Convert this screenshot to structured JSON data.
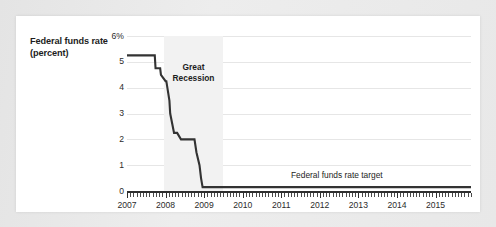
{
  "card": {
    "background_color": "#ffffff",
    "page_background_color": "#e9e9e9"
  },
  "chart_data": {
    "type": "line",
    "title": "",
    "ylabel": "Federal funds rate (percent)",
    "xlabel": "",
    "ylim": [
      0,
      6
    ],
    "xlim": [
      2007.0,
      2015.92
    ],
    "grid": true,
    "legend": "none",
    "line_color": "#333333",
    "y_ticks": [
      0,
      1,
      2,
      3,
      4,
      5,
      6
    ],
    "y_tick_labels": [
      "0",
      "1",
      "2",
      "3",
      "4",
      "5",
      "6%"
    ],
    "x_ticks": [
      2007,
      2008,
      2009,
      2010,
      2011,
      2012,
      2013,
      2014,
      2015
    ],
    "x_tick_labels": [
      "2007",
      "2008",
      "2009",
      "2010",
      "2011",
      "2012",
      "2013",
      "2014",
      "2015"
    ],
    "minor_tick_interval_months": 1,
    "annotations": [
      {
        "id": "recession-band",
        "kind": "shaded-span",
        "label": "Great Recession",
        "label_line_1": "Great",
        "label_line_2": "Recession",
        "x_start": 2007.95,
        "x_end": 2009.5,
        "fill_color": "#f2f2f2"
      },
      {
        "id": "target-line-label",
        "kind": "text",
        "label": "Federal funds rate target",
        "x": 2012.6,
        "y": 0.62
      }
    ],
    "series": [
      {
        "name": "Federal funds rate target",
        "color": "#333333",
        "x": [
          2007.0,
          2007.2,
          2007.4,
          2007.6,
          2007.72,
          2007.74,
          2007.86,
          2007.88,
          2008.0,
          2008.02,
          2008.1,
          2008.12,
          2008.22,
          2008.3,
          2008.4,
          2008.55,
          2008.62,
          2008.64,
          2008.75,
          2008.8,
          2008.88,
          2008.92,
          2008.96,
          2009.0,
          2009.1,
          2009.4,
          2010.0,
          2011.0,
          2012.0,
          2013.0,
          2014.0,
          2015.0,
          2015.6,
          2015.92
        ],
        "y": [
          5.25,
          5.25,
          5.25,
          5.25,
          5.25,
          4.75,
          4.75,
          4.5,
          4.25,
          4.25,
          3.5,
          3.0,
          2.25,
          2.25,
          2.0,
          2.0,
          2.0,
          2.0,
          2.0,
          1.5,
          1.0,
          0.5,
          0.15,
          0.15,
          0.15,
          0.15,
          0.15,
          0.15,
          0.15,
          0.15,
          0.15,
          0.15,
          0.15,
          0.15
        ]
      }
    ]
  }
}
